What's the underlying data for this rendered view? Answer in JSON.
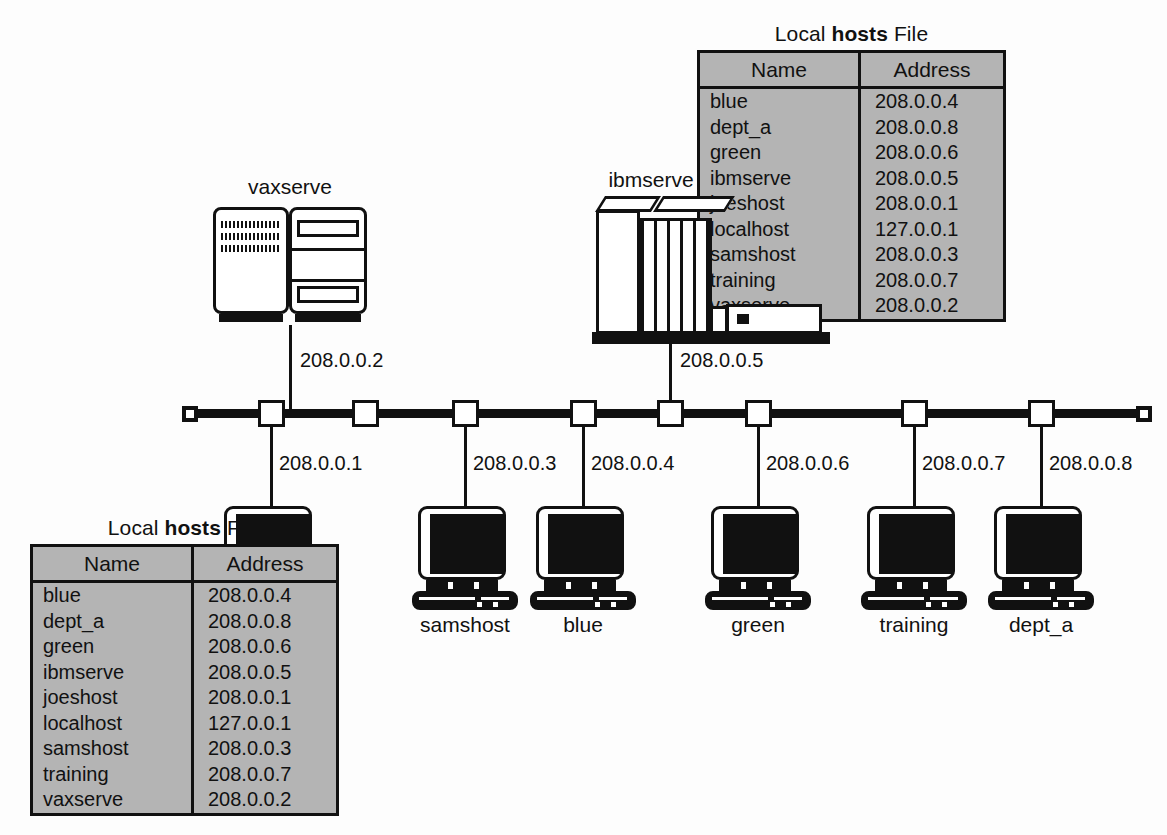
{
  "diagram": {
    "type": "network-topology",
    "bus": {
      "name": "ethernet-bus",
      "taps": 8,
      "terminators": 2
    },
    "hosts_file": {
      "title_prefix": "Local ",
      "title_bold": "hosts",
      "title_suffix": " File",
      "columns": [
        "Name",
        "Address"
      ],
      "rows": [
        {
          "name": "blue",
          "address": "208.0.0.4"
        },
        {
          "name": "dept_a",
          "address": "208.0.0.8"
        },
        {
          "name": "green",
          "address": "208.0.0.6"
        },
        {
          "name": "ibmserve",
          "address": "208.0.0.5"
        },
        {
          "name": "joeshost",
          "address": "208.0.0.1"
        },
        {
          "name": "localhost",
          "address": "127.0.0.1"
        },
        {
          "name": "samshost",
          "address": "208.0.0.3"
        },
        {
          "name": "training",
          "address": "208.0.0.7"
        },
        {
          "name": "vaxserve",
          "address": "208.0.0.2"
        }
      ]
    },
    "servers": [
      {
        "id": "vaxserve",
        "label": "vaxserve",
        "ip": "208.0.0.2",
        "kind": "minicomputer"
      },
      {
        "id": "ibmserve",
        "label": "ibmserve",
        "ip": "208.0.0.5",
        "kind": "mainframe"
      }
    ],
    "workstations": [
      {
        "id": "joeshost",
        "label": "joeshost",
        "ip": "208.0.0.1"
      },
      {
        "id": "samshost",
        "label": "samshost",
        "ip": "208.0.0.3"
      },
      {
        "id": "blue",
        "label": "blue",
        "ip": "208.0.0.4"
      },
      {
        "id": "green",
        "label": "green",
        "ip": "208.0.0.6"
      },
      {
        "id": "training",
        "label": "training",
        "ip": "208.0.0.7"
      },
      {
        "id": "dept_a",
        "label": "dept_a",
        "ip": "208.0.0.8"
      }
    ],
    "colors": {
      "line": "#111111",
      "table_fill": "#b4b4b4",
      "background": "#fdfdfd",
      "screen": "#111111"
    }
  }
}
